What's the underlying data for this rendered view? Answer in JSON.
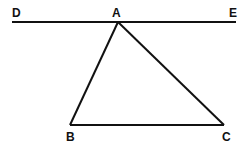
{
  "diagram": {
    "type": "geometry",
    "line_color": "#111111",
    "points": {
      "D": {
        "label": "D",
        "x": 12,
        "y": 22
      },
      "A": {
        "label": "A",
        "x": 118,
        "y": 22
      },
      "E": {
        "label": "E",
        "x": 236,
        "y": 22
      },
      "B": {
        "label": "B",
        "x": 70,
        "y": 125
      },
      "C": {
        "label": "C",
        "x": 224,
        "y": 125
      }
    },
    "segments": [
      "DE",
      "AB",
      "AC",
      "BC"
    ]
  }
}
